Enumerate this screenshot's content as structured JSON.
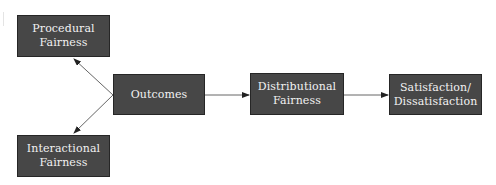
{
  "diagram": {
    "type": "flowchart",
    "nodes": [
      {
        "id": "procedural",
        "lines": [
          "Procedural",
          "Fairness"
        ]
      },
      {
        "id": "interactional",
        "lines": [
          "Interactional",
          "Fairness"
        ]
      },
      {
        "id": "outcomes",
        "lines": [
          "Outcomes"
        ]
      },
      {
        "id": "distributional",
        "lines": [
          "Distributional",
          "Fairness"
        ]
      },
      {
        "id": "satisfaction",
        "lines": [
          "Satisfaction/",
          "Dissatisfaction"
        ]
      }
    ],
    "edges": [
      {
        "from": "outcomes",
        "to": "procedural"
      },
      {
        "from": "outcomes",
        "to": "interactional"
      },
      {
        "from": "outcomes",
        "to": "distributional"
      },
      {
        "from": "distributional",
        "to": "satisfaction"
      }
    ],
    "colors": {
      "node_fill": "#474747",
      "node_border": "#262626",
      "node_text": "#f2f2f2",
      "edge": "#555555"
    }
  }
}
